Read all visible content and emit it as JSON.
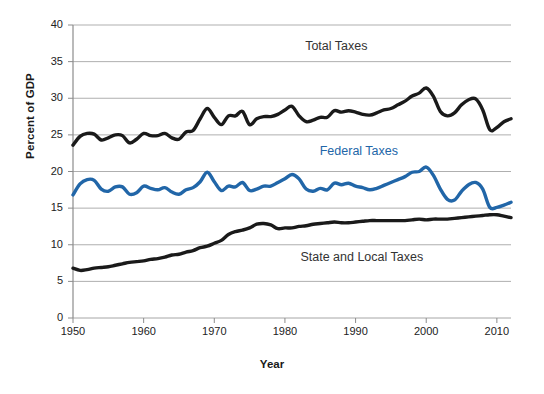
{
  "chart_data": {
    "type": "line",
    "title": "",
    "xlabel": "Year",
    "ylabel": "Percent of GDP",
    "xlim": [
      1950,
      2012
    ],
    "ylim": [
      0,
      40
    ],
    "grid": true,
    "legend_position": "inline-annotations",
    "yticks": [
      0,
      5,
      10,
      15,
      20,
      25,
      30,
      35,
      40
    ],
    "ytick_labels": [
      "0",
      "5",
      "10",
      "15",
      "20",
      "25",
      "30",
      "35",
      "40"
    ],
    "xticks": [
      1950,
      1960,
      1970,
      1980,
      1990,
      2000,
      2010
    ],
    "xtick_labels": [
      "1950",
      "1960",
      "1970",
      "1980",
      "1990",
      "2000",
      "2010"
    ],
    "x": [
      1950,
      1951,
      1952,
      1953,
      1954,
      1955,
      1956,
      1957,
      1958,
      1959,
      1960,
      1961,
      1962,
      1963,
      1964,
      1965,
      1966,
      1967,
      1968,
      1969,
      1970,
      1971,
      1972,
      1973,
      1974,
      1975,
      1976,
      1977,
      1978,
      1979,
      1980,
      1981,
      1982,
      1983,
      1984,
      1985,
      1986,
      1987,
      1988,
      1989,
      1990,
      1991,
      1992,
      1993,
      1994,
      1995,
      1996,
      1997,
      1998,
      1999,
      2000,
      2001,
      2002,
      2003,
      2004,
      2005,
      2006,
      2007,
      2008,
      2009,
      2010,
      2011,
      2012
    ],
    "series": [
      {
        "name": "Total Taxes",
        "color": "#1a1a1a",
        "label_x": 1988,
        "label_y": 37.0,
        "values": [
          23.6,
          24.8,
          25.2,
          25.1,
          24.3,
          24.6,
          25.0,
          24.9,
          23.9,
          24.4,
          25.2,
          24.9,
          24.9,
          25.2,
          24.6,
          24.4,
          25.4,
          25.6,
          27.2,
          28.6,
          27.4,
          26.4,
          27.6,
          27.6,
          28.2,
          26.4,
          27.2,
          27.5,
          27.5,
          27.8,
          28.4,
          28.9,
          27.6,
          26.8,
          27.0,
          27.4,
          27.4,
          28.3,
          28.1,
          28.3,
          28.1,
          27.8,
          27.7,
          28.0,
          28.4,
          28.6,
          29.1,
          29.6,
          30.3,
          30.7,
          31.4,
          30.3,
          28.2,
          27.6,
          28.0,
          29.1,
          29.8,
          29.9,
          28.4,
          25.7,
          26.0,
          26.8,
          27.2
        ]
      },
      {
        "name": "Federal Taxes",
        "color": "#2166a8",
        "label_x": 1991,
        "label_y": 22.6,
        "values": [
          16.8,
          18.3,
          18.9,
          18.8,
          17.6,
          17.3,
          17.9,
          17.9,
          16.9,
          17.1,
          18.0,
          17.7,
          17.5,
          17.8,
          17.2,
          16.9,
          17.5,
          17.8,
          18.6,
          19.9,
          18.6,
          17.4,
          18.0,
          17.9,
          18.5,
          17.4,
          17.6,
          18.0,
          18.0,
          18.5,
          19.0,
          19.6,
          19.0,
          17.6,
          17.3,
          17.7,
          17.5,
          18.4,
          18.2,
          18.4,
          18.0,
          17.8,
          17.5,
          17.7,
          18.1,
          18.5,
          18.9,
          19.3,
          19.9,
          20.0,
          20.6,
          19.5,
          17.6,
          16.2,
          16.1,
          17.3,
          18.2,
          18.5,
          17.6,
          15.1,
          15.1,
          15.4,
          15.8
        ]
      },
      {
        "name": "State and Local Taxes",
        "color": "#1a1a1a",
        "label_x": 1992,
        "label_y": 8.2,
        "values": [
          6.8,
          6.5,
          6.6,
          6.8,
          6.9,
          7.0,
          7.2,
          7.4,
          7.6,
          7.7,
          7.8,
          8.0,
          8.1,
          8.3,
          8.6,
          8.7,
          9.0,
          9.2,
          9.6,
          9.8,
          10.2,
          10.6,
          11.4,
          11.8,
          12.0,
          12.3,
          12.8,
          12.9,
          12.7,
          12.2,
          12.3,
          12.3,
          12.5,
          12.6,
          12.8,
          12.9,
          13.0,
          13.1,
          13.0,
          13.0,
          13.1,
          13.2,
          13.3,
          13.3,
          13.3,
          13.3,
          13.3,
          13.3,
          13.4,
          13.5,
          13.4,
          13.5,
          13.5,
          13.5,
          13.6,
          13.7,
          13.8,
          13.9,
          14.0,
          14.1,
          14.1,
          13.9,
          13.7
        ]
      }
    ]
  }
}
